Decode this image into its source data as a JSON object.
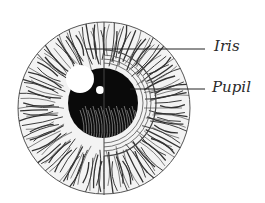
{
  "diagram": {
    "labels": [
      {
        "text": "Iris",
        "target": "iris"
      },
      {
        "text": "Pupil",
        "target": "pupil"
      }
    ],
    "colors": {
      "background": "#ffffff",
      "ink": "#1a1a1a",
      "iris_fill": "#f2f2f2",
      "pupil": "#0a0a0a"
    }
  }
}
